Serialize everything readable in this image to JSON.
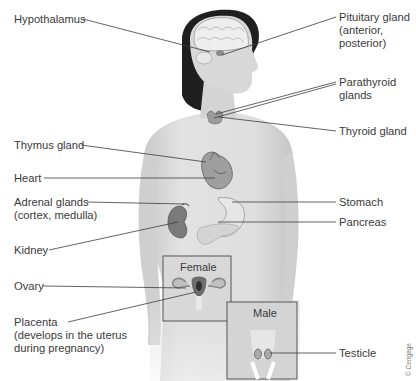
{
  "figure": {
    "labels_left": [
      {
        "id": "hypothalamus",
        "lines": [
          "Hypothalamus"
        ]
      },
      {
        "id": "thymus",
        "lines": [
          "Thymus gland"
        ]
      },
      {
        "id": "heart",
        "lines": [
          "Heart"
        ]
      },
      {
        "id": "adrenal",
        "lines": [
          "Adrenal glands",
          "(cortex, medulla)"
        ]
      },
      {
        "id": "kidney",
        "lines": [
          "Kidney"
        ]
      },
      {
        "id": "ovary",
        "lines": [
          "Ovary"
        ]
      },
      {
        "id": "placenta",
        "lines": [
          "Placenta",
          "(develops in the uterus",
          "during pregnancy)"
        ]
      }
    ],
    "labels_right": [
      {
        "id": "pituitary",
        "lines": [
          "Pituitary gland",
          "(anterior,",
          "posterior)"
        ]
      },
      {
        "id": "parathyroid",
        "lines": [
          "Parathyroid",
          "glands"
        ]
      },
      {
        "id": "thyroid",
        "lines": [
          "Thyroid gland"
        ]
      },
      {
        "id": "stomach",
        "lines": [
          "Stomach"
        ]
      },
      {
        "id": "pancreas",
        "lines": [
          "Pancreas"
        ]
      },
      {
        "id": "testicle",
        "lines": [
          "Testicle"
        ]
      }
    ],
    "insets": {
      "female": "Female",
      "male": "Male"
    },
    "copyright": "© Cengage",
    "colors": {
      "line": "#3c3c3c",
      "text": "#3a3a3a",
      "skin": "#d9d9d9",
      "hair": "#1e1e1e",
      "inset_border": "#555555"
    }
  }
}
